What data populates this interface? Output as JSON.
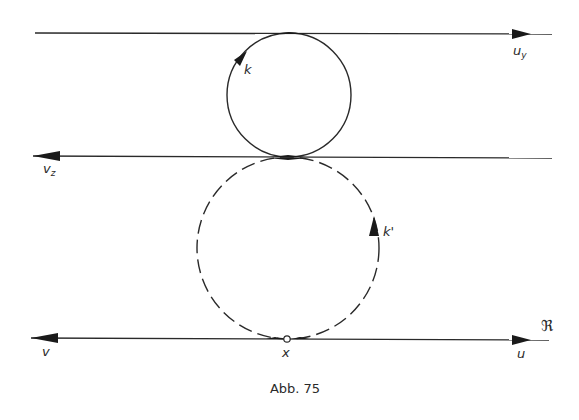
{
  "figure": {
    "caption": "Abb. 75",
    "colors": {
      "ink": "#2a2a2a",
      "background": "#ffffff"
    }
  },
  "lines": [
    {
      "id": "top",
      "label": "u",
      "label_sub": "y",
      "direction": "right",
      "y": 33,
      "x1": 35,
      "x2": 552
    },
    {
      "id": "middle",
      "label": "v",
      "label_sub": "z",
      "direction": "left",
      "y": 157,
      "x1": 33,
      "x2": 552
    },
    {
      "id": "bottom",
      "label_left": "v",
      "label_right": "u",
      "direction": "both-ends-outward",
      "y": 339,
      "x1": 31,
      "x2": 549
    }
  ],
  "circles": [
    {
      "id": "k",
      "label": "k",
      "style": "solid",
      "cx": 289,
      "cy": 95,
      "r": 62,
      "orientation": "counterclockwise"
    },
    {
      "id": "k_prime",
      "label": "k'",
      "style": "dashed",
      "cx": 288,
      "cy": 248,
      "r": 91,
      "orientation": "counterclockwise"
    }
  ],
  "points": [
    {
      "id": "x",
      "label": "x",
      "cx": 287,
      "cy": 339
    }
  ],
  "symbols": {
    "fraktur": "ℜ"
  }
}
